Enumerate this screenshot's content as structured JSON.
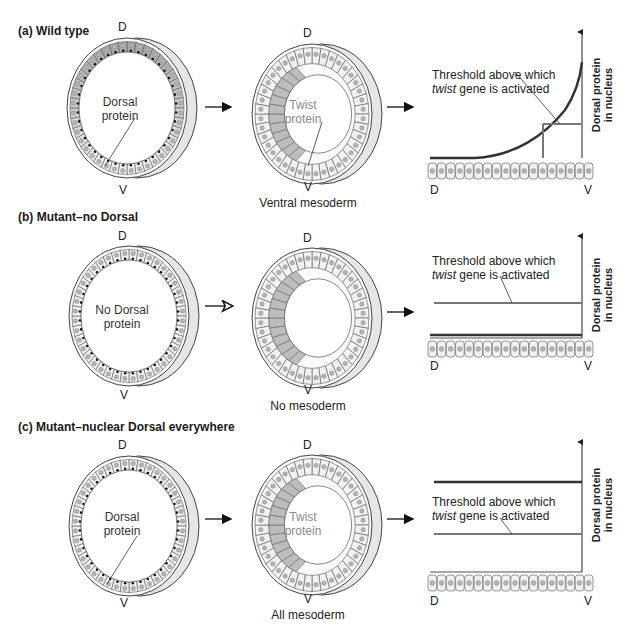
{
  "panels": [
    {
      "id": "a",
      "label": "(a) Wild type",
      "embryo1": {
        "top": "D",
        "bottom": "V",
        "label_line1": "Dorsal",
        "label_line2": "protein"
      },
      "embryo2": {
        "top": "D",
        "bottom": "V",
        "label_line1": "Twist",
        "label_line2": "protein",
        "caption": "Ventral mesoderm"
      },
      "graph": {
        "threshold_line1": "Threshold above which",
        "threshold_italic": "twist",
        "threshold_rest": " gene is activated",
        "ylabel_line1": "Dorsal protein",
        "ylabel_line2": "in nucleus",
        "x_left": "D",
        "x_right": "V"
      }
    },
    {
      "id": "b",
      "label": "(b) Mutant–no Dorsal",
      "embryo1": {
        "top": "D",
        "bottom": "V",
        "label_line1": "No Dorsal",
        "label_line2": "protein"
      },
      "embryo2": {
        "top": "D",
        "bottom": "V",
        "caption": "No mesoderm"
      },
      "graph": {
        "threshold_line1": "Threshold above which",
        "threshold_italic": "twist",
        "threshold_rest": " gene is activated",
        "ylabel_line1": "Dorsal protein",
        "ylabel_line2": "in nucleus",
        "x_left": "D",
        "x_right": "V"
      }
    },
    {
      "id": "c",
      "label": "(c) Mutant–nuclear Dorsal everywhere",
      "embryo1": {
        "top": "D",
        "bottom": "V",
        "label_line1": "Dorsal",
        "label_line2": "protein"
      },
      "embryo2": {
        "top": "D",
        "bottom": "V",
        "label_line1": "Twist",
        "label_line2": "protein",
        "caption": "All mesoderm"
      },
      "graph": {
        "threshold_line1": "Threshold above which",
        "threshold_italic": "twist",
        "threshold_rest": " gene is activated",
        "ylabel_line1": "Dorsal protein",
        "ylabel_line2": "in nucleus",
        "x_left": "D",
        "x_right": "V"
      }
    }
  ],
  "chart_data": [
    {
      "type": "line",
      "panel": "a",
      "title": "Wild type",
      "xlabel": "D → V position",
      "ylabel": "Dorsal protein in nucleus",
      "series": [
        {
          "name": "Dorsal protein",
          "shape": "exponential rise toward V"
        },
        {
          "name": "Threshold",
          "level": 0.35
        }
      ]
    },
    {
      "type": "line",
      "panel": "b",
      "title": "Mutant–no Dorsal",
      "xlabel": "D → V position",
      "ylabel": "Dorsal protein in nucleus",
      "series": [
        {
          "name": "Dorsal protein",
          "level": 0.0
        },
        {
          "name": "Threshold",
          "level": 0.35
        }
      ]
    },
    {
      "type": "line",
      "panel": "c",
      "title": "Mutant–nuclear Dorsal everywhere",
      "xlabel": "D → V position",
      "ylabel": "Dorsal protein in nucleus",
      "series": [
        {
          "name": "Dorsal protein",
          "level": 0.7
        },
        {
          "name": "Threshold",
          "level": 0.35
        }
      ]
    }
  ],
  "colors": {
    "curve": "#333333",
    "threshold": "#777777",
    "cell_fill": "#f2f2f2",
    "nucleus": "#b5b5b5",
    "mesoderm": "#bdbdbd",
    "rim": "#e6e6e6"
  }
}
